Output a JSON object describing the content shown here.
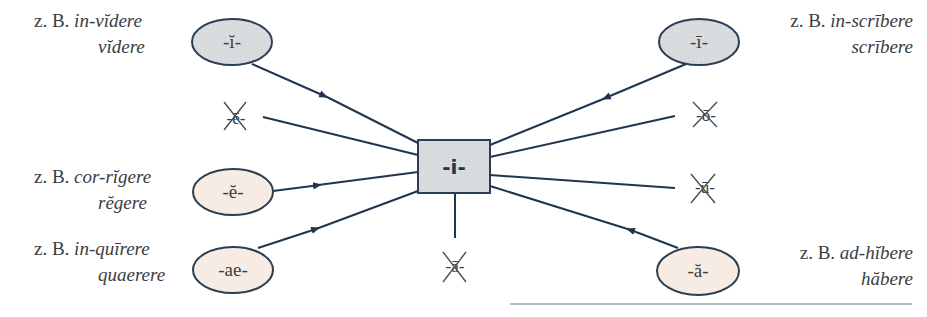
{
  "diagram": {
    "center": {
      "label": "-i-",
      "fill": "#d9dcdf",
      "stroke": "#2c3e55"
    },
    "colors": {
      "line": "#1f3550",
      "gray_fill": "#d9dcdf",
      "cream_fill": "#f6ece3",
      "text": "#3a3e44"
    },
    "sources": [
      {
        "id": "i-short",
        "label": "-ĭ-",
        "fill": "gray",
        "example_prefix": "z. B.",
        "example_compound": "in-vĭdere",
        "example_base": "vĭdere",
        "side": "left"
      },
      {
        "id": "i-long",
        "label": "-ī-",
        "fill": "gray",
        "example_prefix": "z. B.",
        "example_compound": "in-scrībere",
        "example_base": "scrībere",
        "side": "right"
      },
      {
        "id": "e-short",
        "label": "-ĕ-",
        "fill": "cream",
        "example_prefix": "z. B.",
        "example_compound": "cor-rĭgere",
        "example_base": "rĕgere",
        "side": "left"
      },
      {
        "id": "ae",
        "label": "-ae-",
        "fill": "cream",
        "example_prefix": "z. B.",
        "example_compound": "in-quīrere",
        "example_base": "quaerere",
        "side": "left"
      },
      {
        "id": "a-short",
        "label": "-ă-",
        "fill": "cream",
        "example_prefix": "z. B.",
        "example_compound": "ad-hĭbere",
        "example_base": "hăbere",
        "side": "right"
      }
    ],
    "excluded": [
      {
        "id": "e-long",
        "label": "-ē-"
      },
      {
        "id": "o-long",
        "label": "-ō-"
      },
      {
        "id": "u-long",
        "label": "-ū-"
      },
      {
        "id": "a-long",
        "label": "-ā-"
      }
    ]
  }
}
